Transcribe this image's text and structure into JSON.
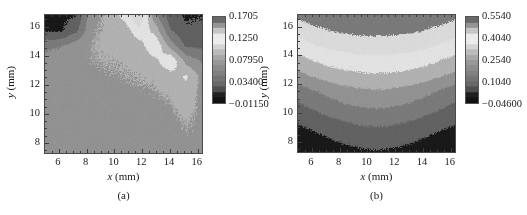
{
  "figure": {
    "panels": [
      {
        "id": "a",
        "caption": "(a)",
        "axis": {
          "x_title_symbol": "x",
          "x_title_unit": "(mm)",
          "y_title_symbol": "y",
          "y_title_unit": "(mm)",
          "x_ticks": [
            "6",
            "8",
            "10",
            "12",
            "14",
            "16"
          ],
          "y_ticks": [
            "8",
            "10",
            "12",
            "14",
            "16"
          ]
        },
        "colorbar": {
          "ticks": [
            "0.1705",
            "0.1250",
            "0.07950",
            "0.03400",
            "−0.01150"
          ]
        }
      },
      {
        "id": "b",
        "caption": "(b)",
        "axis": {
          "x_title_symbol": "x",
          "x_title_unit": "(mm)",
          "y_title_symbol": "y",
          "y_title_unit": "(mm)",
          "x_ticks": [
            "6",
            "8",
            "10",
            "12",
            "14",
            "16"
          ],
          "y_ticks": [
            "8",
            "10",
            "12",
            "14",
            "16"
          ]
        },
        "colorbar": {
          "ticks": [
            "0.5540",
            "0.4040",
            "0.2540",
            "0.1040",
            "−0.04600"
          ]
        }
      }
    ]
  },
  "chart_data": [
    {
      "type": "heatmap",
      "panel": "a",
      "title": "",
      "xlabel": "x (mm)",
      "ylabel": "y (mm)",
      "xlim": [
        5.0,
        16.3
      ],
      "ylim": [
        7.3,
        16.8
      ],
      "xticks": [
        6,
        8,
        10,
        12,
        14,
        16
      ],
      "yticks": [
        8,
        10,
        12,
        14,
        16
      ],
      "grid": false,
      "colorbar": {
        "label": "",
        "tick_values": [
          0.1705,
          0.125,
          0.0795,
          0.034,
          -0.0115
        ],
        "vmin": -0.0115,
        "vmax": 0.1705,
        "colormap": "grayscale-cyclic"
      },
      "description": "Contour map of a field with diagonal banding. Dark patch occupies the upper-left corner above y=14.5 for x<8.5. A second dark region with nested bands occupies the upper-right corner for x>13.5, y>13.5. A narrow bright (near-white) ridge runs diagonally from about (11,16.8) down to (16,13). The lower two thirds of the domain (y<13) is a broad uniform mid-level plateau near 0.06-0.08 with faint contour filaments.",
      "levels": [
        -0.0115,
        0.011,
        0.034,
        0.0565,
        0.0795,
        0.102,
        0.125,
        0.1475,
        0.1705
      ],
      "grid_x": [
        5.0,
        6.13,
        7.26,
        8.39,
        9.52,
        10.65,
        11.78,
        12.91,
        14.04,
        15.17,
        16.3
      ],
      "grid_y": [
        16.8,
        15.75,
        14.7,
        13.65,
        12.6,
        11.55,
        10.5,
        9.45,
        8.4,
        7.35
      ],
      "z": [
        [
          0.005,
          0.005,
          0.01,
          0.075,
          0.082,
          0.11,
          0.15,
          0.062,
          0.02,
          0.008,
          0.01
        ],
        [
          0.008,
          0.008,
          0.03,
          0.078,
          0.082,
          0.086,
          0.12,
          0.095,
          0.035,
          0.014,
          0.016
        ],
        [
          0.05,
          0.055,
          0.07,
          0.08,
          0.082,
          0.084,
          0.09,
          0.125,
          0.07,
          0.03,
          0.03
        ],
        [
          0.066,
          0.07,
          0.076,
          0.079,
          0.08,
          0.081,
          0.083,
          0.095,
          0.125,
          0.072,
          0.055
        ],
        [
          0.07,
          0.072,
          0.075,
          0.077,
          0.078,
          0.079,
          0.08,
          0.082,
          0.09,
          0.105,
          0.072
        ],
        [
          0.07,
          0.071,
          0.073,
          0.075,
          0.076,
          0.077,
          0.078,
          0.079,
          0.082,
          0.092,
          0.074
        ],
        [
          0.069,
          0.07,
          0.071,
          0.073,
          0.074,
          0.075,
          0.076,
          0.077,
          0.078,
          0.085,
          0.076
        ],
        [
          0.068,
          0.069,
          0.07,
          0.072,
          0.073,
          0.074,
          0.075,
          0.075,
          0.076,
          0.08,
          0.077
        ],
        [
          0.068,
          0.068,
          0.069,
          0.071,
          0.072,
          0.073,
          0.074,
          0.074,
          0.075,
          0.078,
          0.077
        ],
        [
          0.067,
          0.068,
          0.069,
          0.07,
          0.071,
          0.072,
          0.073,
          0.073,
          0.074,
          0.076,
          0.076
        ]
      ]
    },
    {
      "type": "heatmap",
      "panel": "b",
      "title": "",
      "xlabel": "x (mm)",
      "ylabel": "y (mm)",
      "xlim": [
        5.0,
        16.3
      ],
      "ylim": [
        7.3,
        16.8
      ],
      "xticks": [
        6,
        8,
        10,
        12,
        14,
        16
      ],
      "yticks": [
        8,
        10,
        12,
        14,
        16
      ],
      "grid": false,
      "colorbar": {
        "label": "",
        "tick_values": [
          0.554,
          0.404,
          0.254,
          0.104,
          -0.046
        ],
        "vmin": -0.046,
        "vmax": 0.554,
        "colormap": "grayscale-cyclic"
      },
      "description": "Contour map with strongly layered, arch-shaped horizontal bands. A bright near-white band sits at about y=11.3-12.0 spanning the full width, arching slightly upward in the middle. Above it the bands step progressively darker toward the top edge. Below it the bands step progressively darker toward the bottom edge, with the darkest band along the bottom around y=7.5-8.5. Bands curve downward at the left and right edges.",
      "levels": [
        -0.046,
        0.029,
        0.104,
        0.179,
        0.254,
        0.329,
        0.404,
        0.479,
        0.554
      ],
      "grid_x": [
        5.0,
        6.13,
        7.26,
        8.39,
        9.52,
        10.65,
        11.78,
        12.91,
        14.04,
        15.17,
        16.3
      ],
      "grid_y": [
        16.8,
        15.75,
        14.7,
        13.65,
        12.6,
        11.55,
        10.5,
        9.45,
        8.4,
        7.35
      ],
      "z": [
        [
          0.5,
          0.52,
          0.535,
          0.545,
          0.55,
          0.552,
          0.55,
          0.545,
          0.535,
          0.52,
          0.5
        ],
        [
          0.43,
          0.46,
          0.48,
          0.492,
          0.498,
          0.5,
          0.498,
          0.492,
          0.48,
          0.46,
          0.435
        ],
        [
          0.37,
          0.4,
          0.42,
          0.432,
          0.44,
          0.442,
          0.44,
          0.432,
          0.42,
          0.4,
          0.375
        ],
        [
          0.3,
          0.33,
          0.355,
          0.37,
          0.378,
          0.38,
          0.378,
          0.37,
          0.355,
          0.33,
          0.305
        ],
        [
          0.23,
          0.262,
          0.288,
          0.305,
          0.314,
          0.318,
          0.314,
          0.305,
          0.288,
          0.262,
          0.232
        ],
        [
          0.14,
          0.175,
          0.205,
          0.228,
          0.242,
          0.248,
          0.242,
          0.228,
          0.205,
          0.175,
          0.142
        ],
        [
          0.09,
          0.118,
          0.145,
          0.168,
          0.182,
          0.188,
          0.182,
          0.168,
          0.145,
          0.118,
          0.092
        ],
        [
          0.04,
          0.062,
          0.085,
          0.105,
          0.118,
          0.124,
          0.118,
          0.105,
          0.085,
          0.062,
          0.042
        ],
        [
          -0.01,
          0.012,
          0.035,
          0.055,
          0.068,
          0.074,
          0.068,
          0.055,
          0.035,
          0.012,
          -0.008
        ],
        [
          -0.04,
          -0.03,
          -0.012,
          0.005,
          0.018,
          0.024,
          0.018,
          0.005,
          -0.012,
          -0.03,
          -0.038
        ]
      ]
    }
  ]
}
